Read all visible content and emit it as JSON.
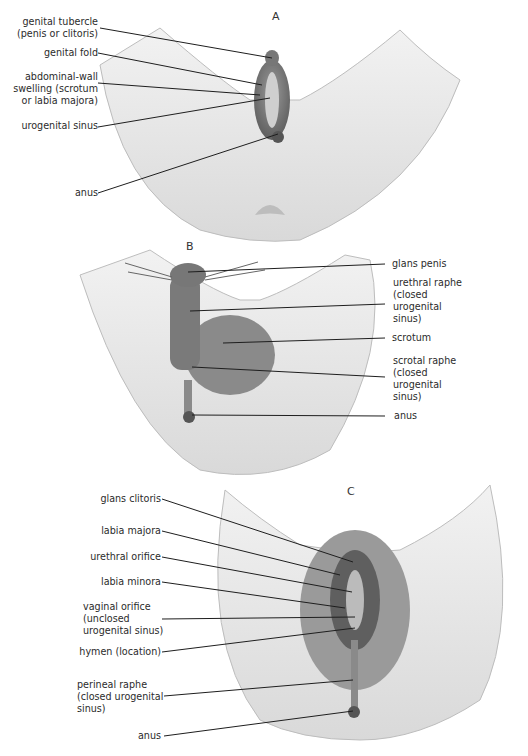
{
  "figure": {
    "panels": [
      {
        "id": "A",
        "letter": "A",
        "labels": [
          {
            "lines": [
              "genital tubercle",
              "(penis or clitoris)"
            ]
          },
          {
            "lines": [
              "genital fold"
            ]
          },
          {
            "lines": [
              "abdominal-wall",
              "swelling (scrotum",
              "or labia majora)"
            ]
          },
          {
            "lines": [
              "urogenital sinus"
            ]
          },
          {
            "lines": [
              "anus"
            ]
          }
        ]
      },
      {
        "id": "B",
        "letter": "B",
        "labels": [
          {
            "lines": [
              "glans penis"
            ]
          },
          {
            "lines": [
              "urethral raphe",
              "(closed",
              "urogenital",
              "sinus)"
            ]
          },
          {
            "lines": [
              "scrotum"
            ]
          },
          {
            "lines": [
              "scrotal raphe",
              "(closed",
              "urogenital",
              "sinus)"
            ]
          },
          {
            "lines": [
              "anus"
            ]
          }
        ]
      },
      {
        "id": "C",
        "letter": "C",
        "labels": [
          {
            "lines": [
              "glans clitoris"
            ]
          },
          {
            "lines": [
              "labia majora"
            ]
          },
          {
            "lines": [
              "urethral orifice"
            ]
          },
          {
            "lines": [
              "labia minora"
            ]
          },
          {
            "lines": [
              "vaginal orifice",
              "(unclosed",
              "urogenital sinus)"
            ]
          },
          {
            "lines": [
              "hymen (location)"
            ]
          },
          {
            "lines": [
              "perineal raphe",
              "(closed urogenital",
              "sinus)"
            ]
          },
          {
            "lines": [
              "anus"
            ]
          }
        ]
      }
    ]
  },
  "colors": {
    "skin_light": "#ececec",
    "skin_mid": "#cfcfcf",
    "skin_dark": "#8f8f8f",
    "leader_line": "#1e1e1e"
  }
}
